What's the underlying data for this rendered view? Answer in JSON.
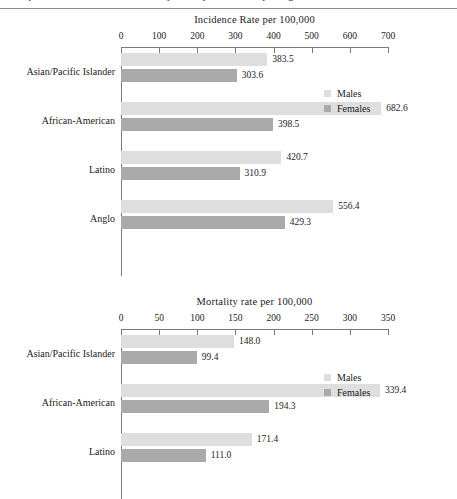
{
  "page": {
    "caption_fragment": "Comparison of incidence and mortality rates by race/ethnicity and gender"
  },
  "legend": {
    "males_label": "Males",
    "females_label": "Females",
    "males_color": "#dedede",
    "females_color": "#aaaaaa"
  },
  "chart_data": [
    {
      "id": "incidence",
      "type": "bar",
      "orientation": "horizontal",
      "title": "Incidence Rate per 100,000",
      "xlabel": "",
      "ylabel": "",
      "xlim": [
        0,
        700
      ],
      "xticks": [
        0,
        100,
        200,
        300,
        400,
        500,
        600,
        700
      ],
      "xticklabels": [
        "0",
        "100",
        "200",
        "300",
        "400",
        "500",
        "600",
        "700"
      ],
      "grid": false,
      "legend_position": "top-right",
      "categories": [
        "Asian/Pacific Islander",
        "African-American",
        "Latino",
        "Anglo"
      ],
      "series": [
        {
          "name": "Males",
          "color": "#dedede",
          "values": [
            383.5,
            682.6,
            420.7,
            556.4
          ],
          "labels": [
            "383.5",
            "682.6",
            "420.7",
            "556.4"
          ]
        },
        {
          "name": "Females",
          "color": "#aaaaaa",
          "values": [
            303.6,
            398.5,
            310.9,
            429.3
          ],
          "labels": [
            "303.6",
            "398.5",
            "310.9",
            "429.3"
          ]
        }
      ]
    },
    {
      "id": "mortality",
      "type": "bar",
      "orientation": "horizontal",
      "title": "Mortality rate per 100,000",
      "xlabel": "",
      "ylabel": "",
      "xlim": [
        0,
        350
      ],
      "xticks": [
        0,
        50,
        100,
        150,
        200,
        250,
        300,
        350
      ],
      "xticklabels": [
        "0",
        "50",
        "100",
        "150",
        "200",
        "250",
        "300",
        "350"
      ],
      "grid": false,
      "legend_position": "top-right",
      "categories": [
        "Asian/Pacific Islander",
        "African-American",
        "Latino"
      ],
      "series": [
        {
          "name": "Males",
          "color": "#dedede",
          "values": [
            148.0,
            339.4,
            171.4
          ],
          "labels": [
            "148.0",
            "339.4",
            "171.4"
          ]
        },
        {
          "name": "Females",
          "color": "#aaaaaa",
          "values": [
            99.4,
            194.3,
            111.0
          ],
          "labels": [
            "99.4",
            "194.3",
            "111.0"
          ]
        }
      ]
    }
  ]
}
